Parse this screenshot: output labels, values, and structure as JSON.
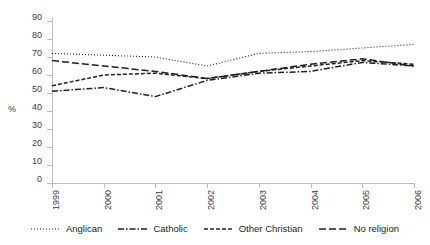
{
  "chart_data": {
    "type": "line",
    "title": "",
    "xlabel": "",
    "ylabel": "%",
    "grid": false,
    "legend_position": "bottom",
    "categories": [
      "1999",
      "2000",
      "2001",
      "2002",
      "2003",
      "2004",
      "2005",
      "2006"
    ],
    "x": [
      1999,
      2000,
      2001,
      2002,
      2003,
      2004,
      2005,
      2006
    ],
    "xlim": [
      1999,
      2006
    ],
    "ylim": [
      0,
      90
    ],
    "ytick_labels": [
      "0",
      "10",
      "20",
      "30",
      "40",
      "50",
      "60",
      "70",
      "80",
      "90"
    ],
    "ytick_values": [
      0,
      10,
      20,
      30,
      40,
      50,
      60,
      70,
      80,
      90
    ],
    "series": [
      {
        "name": "Anglican",
        "dash_style": "dotted",
        "color": "#231f20",
        "values": [
          72,
          71,
          70,
          65,
          72,
          73,
          75,
          77
        ]
      },
      {
        "name": "Catholic",
        "dash_style": "dash-dot",
        "color": "#231f20",
        "values": [
          51,
          53,
          48,
          57,
          61,
          62,
          67,
          65
        ]
      },
      {
        "name": "Other Christian",
        "dash_style": "short-dash",
        "color": "#231f20",
        "values": [
          54,
          60,
          61,
          58,
          62,
          65,
          68,
          66
        ]
      },
      {
        "name": "No religion",
        "dash_style": "long-dash",
        "color": "#231f20",
        "values": [
          68,
          65,
          62,
          58,
          62,
          66,
          69,
          65
        ]
      }
    ]
  },
  "legend": {
    "items": [
      {
        "label": "Anglican"
      },
      {
        "label": "Catholic"
      },
      {
        "label": "Other Christian"
      },
      {
        "label": "No religion"
      }
    ]
  },
  "axis": {
    "y_title": "%"
  }
}
